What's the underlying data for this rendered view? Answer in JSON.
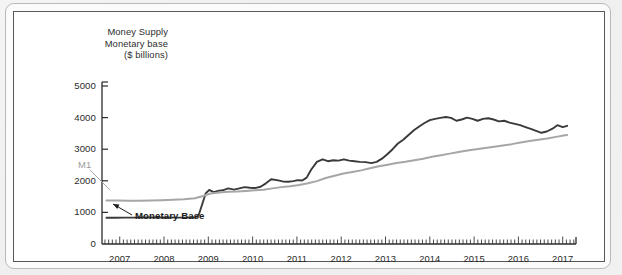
{
  "figure": {
    "title_lines": [
      "Money Supply",
      "Monetary base",
      "($ billions)"
    ],
    "annotations": {
      "m1_label": "M1",
      "monetary_base_label": "Monetary Base"
    },
    "colors": {
      "monetary_base_line": "#3a3a3a",
      "m1_line": "#a6a6a6",
      "axis": "#2b2b2b",
      "frame": "#585858",
      "page_background": "#f1f1f1",
      "plot_background": "#ffffff"
    }
  },
  "chart_data": {
    "type": "line",
    "title": "Money Supply Monetary base ($ billions)",
    "xlabel": "",
    "ylabel": "$ billions",
    "ylim": [
      0,
      5000
    ],
    "xlim": [
      2006.6,
      2017.3
    ],
    "ytick_labels": [
      "0",
      "1000",
      "2000",
      "3000",
      "4000",
      "5000"
    ],
    "yticks": [
      0,
      1000,
      2000,
      3000,
      4000,
      5000
    ],
    "xtick_labels": [
      "2007",
      "2008",
      "2009",
      "2010",
      "2011",
      "2012",
      "2013",
      "2014",
      "2015",
      "2016",
      "2017"
    ],
    "xticks": [
      2007,
      2008,
      2009,
      2010,
      2011,
      2012,
      2013,
      2014,
      2015,
      2016,
      2017
    ],
    "minor_ticks": "monthly",
    "grid": false,
    "legend": "inline-annotations",
    "series": [
      {
        "name": "Monetary Base",
        "color": "#3a3a3a",
        "x": [
          2006.7,
          2006.9,
          2007.1,
          2007.3,
          2007.5,
          2007.7,
          2007.9,
          2008.1,
          2008.3,
          2008.5,
          2008.62,
          2008.7,
          2008.78,
          2008.86,
          2008.94,
          2009.02,
          2009.12,
          2009.22,
          2009.32,
          2009.45,
          2009.58,
          2009.7,
          2009.82,
          2009.94,
          2010.05,
          2010.18,
          2010.3,
          2010.42,
          2010.55,
          2010.68,
          2010.8,
          2010.92,
          2011.02,
          2011.12,
          2011.22,
          2011.32,
          2011.45,
          2011.58,
          2011.7,
          2011.82,
          2011.94,
          2012.06,
          2012.18,
          2012.3,
          2012.42,
          2012.55,
          2012.68,
          2012.8,
          2012.92,
          2013.04,
          2013.16,
          2013.28,
          2013.4,
          2013.52,
          2013.64,
          2013.76,
          2013.88,
          2014.0,
          2014.12,
          2014.24,
          2014.36,
          2014.48,
          2014.6,
          2014.72,
          2014.84,
          2014.96,
          2015.08,
          2015.2,
          2015.32,
          2015.44,
          2015.56,
          2015.68,
          2015.8,
          2015.92,
          2016.04,
          2016.16,
          2016.28,
          2016.4,
          2016.52,
          2016.64,
          2016.76,
          2016.88,
          2017.0,
          2017.1
        ],
        "y": [
          830,
          830,
          835,
          835,
          838,
          840,
          840,
          838,
          835,
          835,
          838,
          845,
          900,
          1250,
          1600,
          1710,
          1640,
          1680,
          1700,
          1760,
          1720,
          1760,
          1800,
          1780,
          1770,
          1810,
          1920,
          2050,
          2020,
          1980,
          1970,
          1990,
          2020,
          2010,
          2100,
          2350,
          2600,
          2680,
          2620,
          2650,
          2640,
          2680,
          2640,
          2620,
          2600,
          2590,
          2560,
          2600,
          2700,
          2840,
          3000,
          3180,
          3300,
          3450,
          3600,
          3720,
          3830,
          3920,
          3960,
          3990,
          4020,
          3990,
          3900,
          3940,
          4000,
          3960,
          3900,
          3960,
          3980,
          3940,
          3880,
          3900,
          3840,
          3800,
          3760,
          3700,
          3640,
          3580,
          3520,
          3560,
          3640,
          3760,
          3700,
          3740
        ]
      },
      {
        "name": "M1",
        "color": "#a6a6a6",
        "x": [
          2006.7,
          2006.95,
          2007.2,
          2007.45,
          2007.7,
          2007.95,
          2008.2,
          2008.45,
          2008.7,
          2008.88,
          2009.05,
          2009.25,
          2009.45,
          2009.65,
          2009.85,
          2010.05,
          2010.25,
          2010.45,
          2010.65,
          2010.85,
          2011.05,
          2011.25,
          2011.45,
          2011.65,
          2011.85,
          2012.05,
          2012.25,
          2012.45,
          2012.65,
          2012.85,
          2013.05,
          2013.25,
          2013.45,
          2013.65,
          2013.85,
          2014.05,
          2014.25,
          2014.45,
          2014.65,
          2014.85,
          2015.05,
          2015.25,
          2015.45,
          2015.65,
          2015.85,
          2016.05,
          2016.25,
          2016.45,
          2016.65,
          2016.85,
          2017.05,
          2017.1
        ],
        "y": [
          1380,
          1375,
          1370,
          1370,
          1375,
          1385,
          1400,
          1415,
          1450,
          1520,
          1600,
          1630,
          1650,
          1660,
          1680,
          1700,
          1720,
          1760,
          1800,
          1830,
          1870,
          1920,
          1990,
          2090,
          2160,
          2230,
          2280,
          2330,
          2400,
          2460,
          2510,
          2560,
          2600,
          2650,
          2700,
          2760,
          2810,
          2860,
          2910,
          2960,
          3000,
          3040,
          3080,
          3120,
          3160,
          3210,
          3260,
          3300,
          3340,
          3390,
          3440,
          3450
        ]
      }
    ]
  }
}
